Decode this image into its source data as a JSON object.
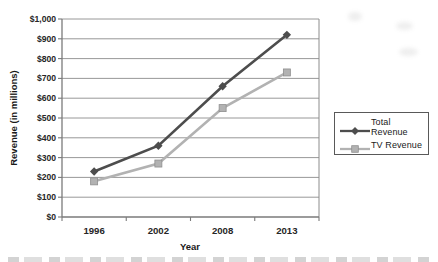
{
  "chart_data": {
    "type": "line",
    "title": "",
    "categories": [
      "1996",
      "2002",
      "2008",
      "2013"
    ],
    "series": [
      {
        "name": "Total Revenue",
        "values": [
          230,
          360,
          660,
          920
        ],
        "color": "#4d4d4d",
        "marker": "diamond"
      },
      {
        "name": "TV Revenue",
        "values": [
          180,
          270,
          550,
          730
        ],
        "color": "#b2b2b2",
        "marker": "square",
        "marker_edge": "#8f8f8f"
      }
    ],
    "xlabel": "Year",
    "ylabel": "Revenue (in millions)",
    "ylim": [
      0,
      1000
    ],
    "ytick_step": 100,
    "ytick_labels": [
      "$0",
      "$100",
      "$200",
      "$300",
      "$400",
      "$500",
      "$600",
      "$700",
      "$800",
      "$900",
      "$1,000"
    ],
    "grid": true,
    "legend_position": "right"
  },
  "colors": {
    "gridline": "#8c8c8c",
    "axis": "#7a7a7a",
    "tick_label": "#262626",
    "legend_border": "#595959",
    "background": "#ffffff"
  }
}
